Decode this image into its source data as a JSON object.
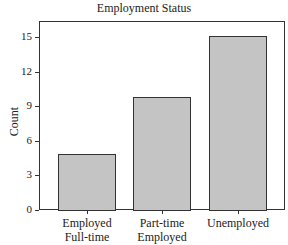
{
  "chart_data": {
    "type": "bar",
    "title": "Employment Status",
    "xlabel": "",
    "ylabel": "Count",
    "categories": [
      "Employed Full-time",
      "Part-time Employed",
      "Unemployed"
    ],
    "category_lines": [
      [
        "Employed",
        "Full-time"
      ],
      [
        "Part-time",
        "Employed"
      ],
      [
        "Unemployed",
        ""
      ]
    ],
    "values": [
      4.9,
      9.8,
      15.1
    ],
    "ylim": [
      0,
      16.4
    ],
    "yticks": [
      0,
      3,
      6,
      9,
      12,
      15
    ],
    "grid": false,
    "legend": null,
    "bar_color": "#c4c4c4",
    "edge_color": "#333333"
  }
}
